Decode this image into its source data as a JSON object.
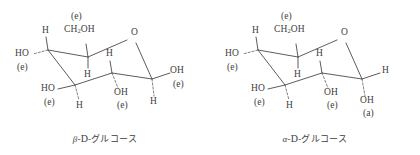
{
  "figure": {
    "title_hidden": "",
    "line_color": "#4a4a4a",
    "text_color": "#3d3d3d",
    "background": "#ffffff"
  },
  "molecules": [
    {
      "id": "beta-d-glucose",
      "caption_anomer": "β",
      "caption_sep1": "-",
      "caption_config": "D",
      "caption_sep2": "-",
      "caption_name": "グルコース",
      "caption_full": "β-D-グルコース",
      "labels": {
        "c6_conf": "(e)",
        "c6_group": "CH2OH",
        "c6_group_pre": "CH",
        "c6_group_sub": "2",
        "c6_group_post": "OH",
        "c5_h": "H",
        "c4_h": "H",
        "c4_oh": "HO",
        "c4_conf": "(e)",
        "c3_oh": "HO",
        "c3_conf": "(e)",
        "c3_h": "H",
        "c2_h": "H",
        "c2_oh": "OH",
        "c2_conf": "(e)",
        "ring_o": "O",
        "c1_oh": "OH",
        "c1_conf": "(e)",
        "c1_h": "H"
      }
    },
    {
      "id": "alpha-d-glucose",
      "caption_anomer": "α",
      "caption_sep1": "-",
      "caption_config": "D",
      "caption_sep2": "-",
      "caption_name": "グルコース",
      "caption_full": "α-D-グルコース",
      "labels": {
        "c6_conf": "(e)",
        "c6_group": "CH2OH",
        "c6_group_pre": "CH",
        "c6_group_sub": "2",
        "c6_group_post": "OH",
        "c5_h": "H",
        "c4_h": "H",
        "c4_oh": "HO",
        "c4_conf": "(e)",
        "c3_oh": "HO",
        "c3_conf": "(e)",
        "c3_h": "H",
        "c2_h": "H",
        "c2_oh": "OH",
        "c2_conf": "(e)",
        "ring_o": "O",
        "c1_h": "H",
        "c1_oh": "OH",
        "c1_conf": "(a)"
      }
    }
  ]
}
